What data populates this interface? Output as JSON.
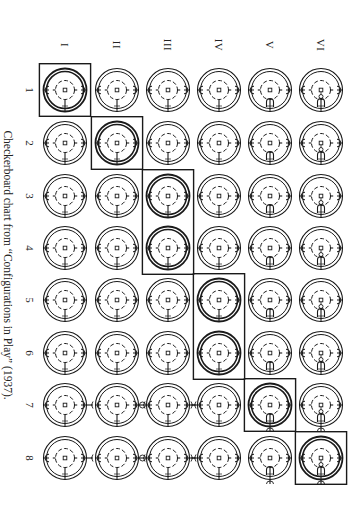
{
  "figure": {
    "caption": "Checkerboard chart from “Configurations in Play” (1937).",
    "orientation": "rotated-90-clockwise"
  },
  "grid": {
    "column_labels": [
      "I",
      "II",
      "III",
      "IV",
      "V",
      "VI"
    ],
    "row_labels": [
      "1",
      "2",
      "3",
      "4",
      "5",
      "6",
      "7",
      "8"
    ],
    "column_x": [
      65,
      117,
      168,
      219,
      270,
      321
    ],
    "row_y": [
      90,
      143,
      196,
      248,
      300,
      353,
      405,
      458
    ],
    "highlight_boxes": [
      {
        "column": "I",
        "rows": [
          "1"
        ]
      },
      {
        "column": "II",
        "rows": [
          "2"
        ]
      },
      {
        "column": "III",
        "rows": [
          "3",
          "4"
        ]
      },
      {
        "column": "IV",
        "rows": [
          "5",
          "6"
        ]
      },
      {
        "column": "V",
        "rows": [
          "7"
        ]
      },
      {
        "column": "VI",
        "rows": [
          "8"
        ]
      }
    ],
    "cell_symbol": "double-ring-with-dashed-inner-circle-center-square-side-notches",
    "column_variants": {
      "I": "plain",
      "II": "plain",
      "III": "plain",
      "IV": "plain",
      "V": "bottom-arch",
      "VI": "figure-in-bottom-arch"
    },
    "row_variants": {
      "7": "external-connectors",
      "8": "external-connectors"
    }
  },
  "colors": {
    "ink": "#1a1a1a",
    "paper": "#ffffff"
  }
}
